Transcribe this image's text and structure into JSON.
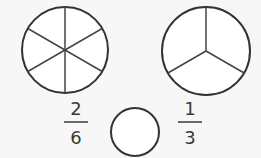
{
  "colors": {
    "background": "#f7f7f7",
    "stroke": "#333333",
    "fill": "#ffffff",
    "text": "#3a3a3a"
  },
  "left_circle": {
    "parts": 6,
    "shaded": 0
  },
  "right_circle": {
    "parts": 3,
    "shaded": 0
  },
  "left_fraction": {
    "numerator": "2",
    "denominator": "6"
  },
  "right_fraction": {
    "numerator": "1",
    "denominator": "3"
  },
  "comparison_blank": {
    "symbol": ""
  }
}
